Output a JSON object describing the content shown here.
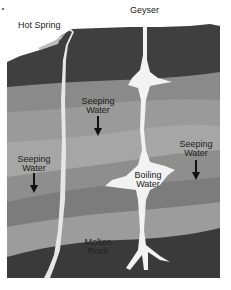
{
  "diagram": {
    "labels": {
      "hot_spring": "Hot Spring",
      "geyser": "Geyser",
      "seeping_water_1": [
        "Seeping",
        "Water"
      ],
      "seeping_water_2": [
        "Seeping",
        "Water"
      ],
      "seeping_water_3": [
        "Seeping",
        "Water"
      ],
      "boiling_water": [
        "Boiling",
        "Water"
      ],
      "molten_rock": [
        "Molten",
        "Rock"
      ]
    },
    "colors": {
      "top_rock": "#3f3f3f",
      "layer_1": "#8a8a8a",
      "layer_2": "#9a9a9a",
      "layer_3": "#a6a6a6",
      "layer_4": "#8e8e8e",
      "layer_5": "#7a7a7a",
      "layer_6": "#9c9c9c",
      "magma": "#3a3a3a",
      "water": "#f2f2f2",
      "arrow": "#111111"
    }
  }
}
